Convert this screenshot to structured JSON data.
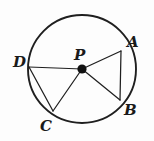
{
  "figure": {
    "background_color": "#fdfdfd",
    "stroke_color": "#1f1f1f",
    "label_color": "#1a1a1a",
    "circle": {
      "center_label": "P",
      "center_x": 82,
      "center_y": 69,
      "radius": 54
    },
    "center_point": {
      "label": "P",
      "label_x": 74,
      "label_y": 60,
      "dot_x": 82,
      "dot_y": 69,
      "dot_radius": 4.6
    },
    "points": [
      {
        "label": "A",
        "x": 121,
        "y": 51,
        "label_x": 127,
        "label_y": 47
      },
      {
        "label": "B",
        "x": 120,
        "y": 100,
        "label_x": 124,
        "label_y": 115
      },
      {
        "label": "C",
        "x": 53,
        "y": 111,
        "label_x": 40,
        "label_y": 131
      },
      {
        "label": "D",
        "x": 29,
        "y": 67,
        "label_x": 13,
        "label_y": 67
      }
    ],
    "radii": [
      {
        "name": "PA",
        "from": "P",
        "to": "A"
      },
      {
        "name": "PB",
        "from": "P",
        "to": "B"
      },
      {
        "name": "PC",
        "from": "P",
        "to": "C"
      },
      {
        "name": "PD",
        "from": "P",
        "to": "D"
      }
    ],
    "chords": [
      {
        "name": "AB",
        "from": "A",
        "to": "B"
      },
      {
        "name": "DC",
        "from": "D",
        "to": "C"
      }
    ]
  }
}
